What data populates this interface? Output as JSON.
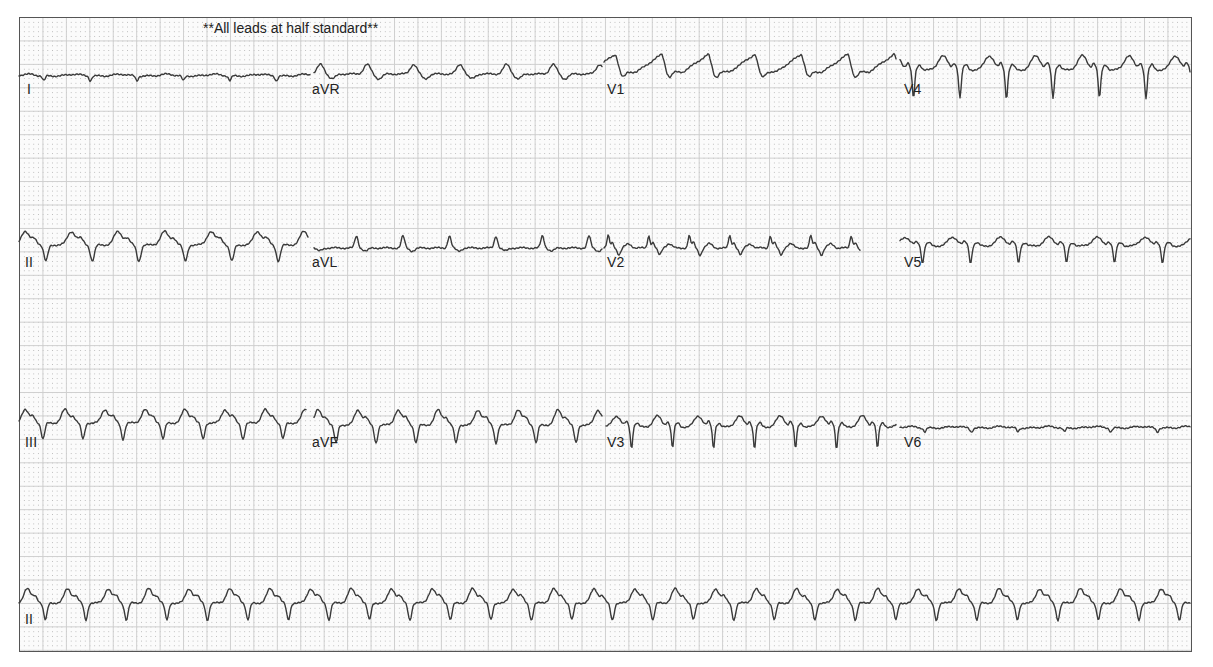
{
  "header": {
    "note": "**All leads at half standard**"
  },
  "colors": {
    "trace": "#3a3a3a",
    "grid_major": "#cfcfcf",
    "grid_minor_dot": "#b9b9b9",
    "border": "#555555",
    "paper": "#fbfbfb"
  },
  "leads": [
    {
      "id": "I",
      "label": "I",
      "label_x": 27,
      "label_y": 94,
      "x0": 19,
      "x1": 310,
      "baseline": 76,
      "beat": 46.5,
      "phase": 10,
      "shape": "flatdip",
      "amp": 6
    },
    {
      "id": "aVR",
      "label": "aVR",
      "label_x": 312,
      "label_y": 94,
      "x0": 314,
      "x1": 602,
      "baseline": 74,
      "beat": 46.5,
      "phase": 12,
      "shape": "peaked",
      "amp": 12
    },
    {
      "id": "V1",
      "label": "V1",
      "label_x": 607,
      "label_y": 94,
      "x0": 604,
      "x1": 896,
      "baseline": 72,
      "beat": 46.5,
      "phase": 14,
      "shape": "sawtooth",
      "amp": 20
    },
    {
      "id": "V4",
      "label": "V4",
      "label_x": 904,
      "label_y": 94,
      "x0": 900,
      "x1": 1190,
      "baseline": 70,
      "beat": 46.5,
      "phase": 20,
      "shape": "deepS",
      "amp": 26
    },
    {
      "id": "II",
      "label": "II",
      "label_x": 25,
      "label_y": 267,
      "x0": 19,
      "x1": 308,
      "baseline": 245,
      "beat": 46.5,
      "phase": 8,
      "shape": "wideQRS",
      "amp": 18
    },
    {
      "id": "aVL",
      "label": "aVL",
      "label_x": 312,
      "label_y": 267,
      "x0": 314,
      "x1": 602,
      "baseline": 248,
      "beat": 46.5,
      "phase": 18,
      "shape": "smallpeak",
      "amp": 12
    },
    {
      "id": "V2",
      "label": "V2",
      "label_x": 607,
      "label_y": 267,
      "x0": 604,
      "x1": 860,
      "baseline": 248,
      "beat": 40.5,
      "phase": 10,
      "shape": "notched",
      "amp": 14
    },
    {
      "id": "V5",
      "label": "V5",
      "label_x": 904,
      "label_y": 267,
      "x0": 900,
      "x1": 1190,
      "baseline": 246,
      "beat": 48,
      "phase": 12,
      "shape": "deepS",
      "amp": 16
    },
    {
      "id": "III",
      "label": "III",
      "label_x": 25,
      "label_y": 447,
      "x0": 19,
      "x1": 306,
      "baseline": 423,
      "beat": 40,
      "phase": 6,
      "shape": "wideQRS",
      "amp": 18
    },
    {
      "id": "aVF",
      "label": "aVF",
      "label_x": 312,
      "label_y": 447,
      "x0": 314,
      "x1": 602,
      "baseline": 425,
      "beat": 40,
      "phase": 8,
      "shape": "wideQRS",
      "amp": 20
    },
    {
      "id": "V3",
      "label": "V3",
      "label_x": 607,
      "label_y": 447,
      "x0": 606,
      "x1": 896,
      "baseline": 427,
      "beat": 41,
      "phase": 4,
      "shape": "deepS",
      "amp": 20
    },
    {
      "id": "V6",
      "label": "V6",
      "label_x": 904,
      "label_y": 447,
      "x0": 900,
      "x1": 1190,
      "baseline": 428,
      "beat": 46.5,
      "phase": 10,
      "shape": "flatdip",
      "amp": 5
    },
    {
      "id": "II_rhythm",
      "label": "II",
      "label_x": 25,
      "label_y": 624,
      "x0": 19,
      "x1": 1190,
      "baseline": 603,
      "beat": 40.5,
      "phase": 4,
      "shape": "wideQRS",
      "amp": 19
    }
  ]
}
